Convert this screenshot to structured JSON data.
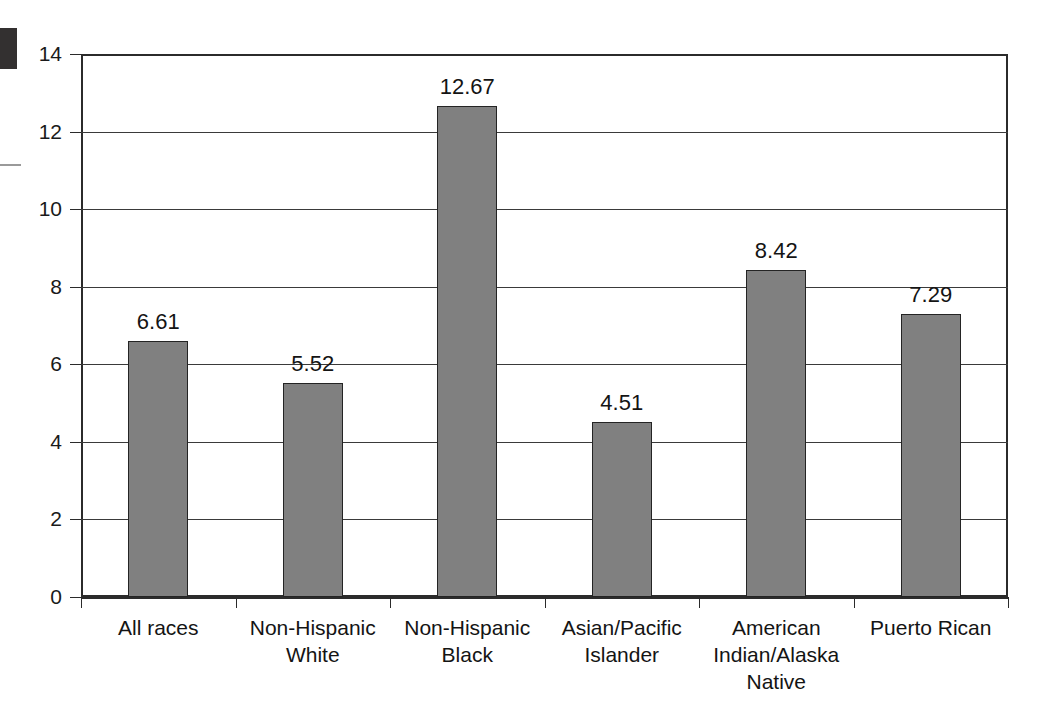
{
  "chart_data": {
    "type": "bar",
    "title": "",
    "subtitle": "",
    "xlabel": "",
    "ylabel": "",
    "categories": [
      "All races",
      "Non-Hispanic White",
      "Non-Hispanic Black",
      "Asian/Pacific Islander",
      "American Indian/Alaska Native",
      "Puerto Rican"
    ],
    "category_lines": [
      [
        "All races"
      ],
      [
        "Non-Hispanic",
        "White"
      ],
      [
        "Non-Hispanic",
        "Black"
      ],
      [
        "Asian/Pacific",
        "Islander"
      ],
      [
        "American",
        "Indian/Alaska",
        "Native"
      ],
      [
        "Puerto Rican"
      ]
    ],
    "values": [
      6.61,
      5.52,
      12.67,
      4.51,
      8.42,
      7.29
    ],
    "value_labels": [
      "6.61",
      "5.52",
      "12.67",
      "4.51",
      "8.42",
      "7.29"
    ],
    "ylim": [
      0,
      14
    ],
    "ytick_values": [
      0,
      2,
      4,
      6,
      8,
      10,
      12,
      14
    ],
    "ytick_labels": [
      "0",
      "2",
      "4",
      "6",
      "8",
      "10",
      "12",
      "14"
    ],
    "grid": true,
    "grid_axis": "y",
    "legend": false,
    "legend_position": "none",
    "bar_color": "#808080",
    "bar_edge_color": "#242424",
    "axis_color": "#2b2b2b",
    "grid_color": "#3a3a3a",
    "background_color": "#ffffff",
    "text_color": "#141414"
  },
  "artifacts": {
    "corner_block_color": "#333030",
    "edge_dash_color": "#9a9a9a"
  }
}
